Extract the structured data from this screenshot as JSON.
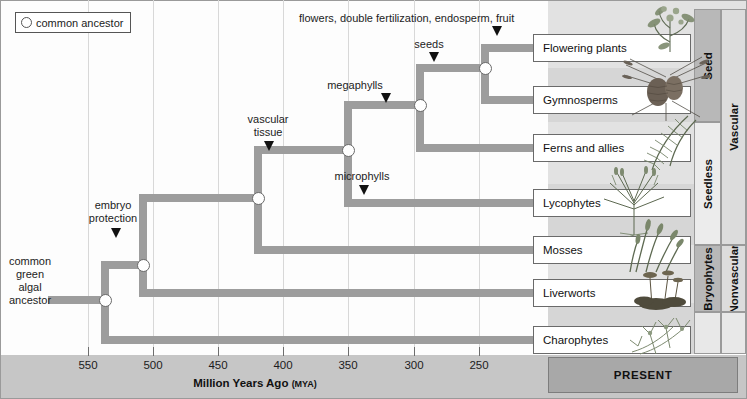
{
  "legend": {
    "label": "common ancestor",
    "icon": "circle-node-icon"
  },
  "axis": {
    "title": "Million Years Ago",
    "title_unit": "(MYA)",
    "present_label": "PRESENT",
    "ticks": [
      {
        "label": "550",
        "x": 88
      },
      {
        "label": "500",
        "x": 153
      },
      {
        "label": "450",
        "x": 218
      },
      {
        "label": "400",
        "x": 283
      },
      {
        "label": "350",
        "x": 348
      },
      {
        "label": "300",
        "x": 414
      },
      {
        "label": "250",
        "x": 479
      }
    ]
  },
  "root_label": "common green algal ancestor",
  "root_label_lines": [
    "common",
    "green",
    "algal",
    "ancestor"
  ],
  "traits": [
    {
      "name": "embryo-protection",
      "lines": [
        "embryo",
        "protection"
      ],
      "label": "embryo protection"
    },
    {
      "name": "vascular-tissue",
      "lines": [
        "vascular",
        "tissue"
      ],
      "label": "vascular tissue"
    },
    {
      "name": "microphylls",
      "lines": [
        "microphylls"
      ],
      "label": "microphylls"
    },
    {
      "name": "megaphylls",
      "lines": [
        "megaphylls"
      ],
      "label": "megaphylls"
    },
    {
      "name": "seeds",
      "lines": [
        "seeds"
      ],
      "label": "seeds"
    },
    {
      "name": "flowers-fruit",
      "lines": [
        "flowers, double fertilization, endosperm, fruit"
      ],
      "label": "flowers, double fertilization, endosperm, fruit"
    }
  ],
  "taxa": [
    {
      "name": "flowering-plants",
      "label": "Flowering plants",
      "art": "flowering-plant-illustration"
    },
    {
      "name": "gymnosperms",
      "label": "Gymnosperms",
      "art": "pine-cone-illustration"
    },
    {
      "name": "ferns-and-allies",
      "label": "Ferns and allies",
      "art": "fern-frond-illustration"
    },
    {
      "name": "lycophytes",
      "label": "Lycophytes",
      "art": "lycophyte-illustration"
    },
    {
      "name": "mosses",
      "label": "Mosses",
      "art": "moss-illustration"
    },
    {
      "name": "liverworts",
      "label": "Liverworts",
      "art": "liverwort-illustration"
    },
    {
      "name": "charophytes",
      "label": "Charophytes",
      "art": "charophyte-alga-illustration"
    }
  ],
  "groups_inner": [
    {
      "name": "seed",
      "label": "Seed",
      "shade": "dark"
    },
    {
      "name": "seedless",
      "label": "Seedless",
      "shade": "light"
    },
    {
      "name": "bryophytes",
      "label": "Bryophytes",
      "shade": "dark"
    }
  ],
  "groups_outer": [
    {
      "name": "vascular",
      "label": "Vascular",
      "shade": "plain"
    },
    {
      "name": "nonvascular",
      "label": "Nonvascular",
      "shade": "plain"
    }
  ],
  "colors": {
    "branch": "#9d9d9d",
    "node_fill": "#ffffff",
    "node_stroke": "#6a6a6a",
    "axis_band": "#c6c6c6",
    "present_band": "#a8a8a8",
    "panel": "#d6d6d6",
    "band_dark": "#b8b8b8",
    "band_light": "#ececec"
  }
}
